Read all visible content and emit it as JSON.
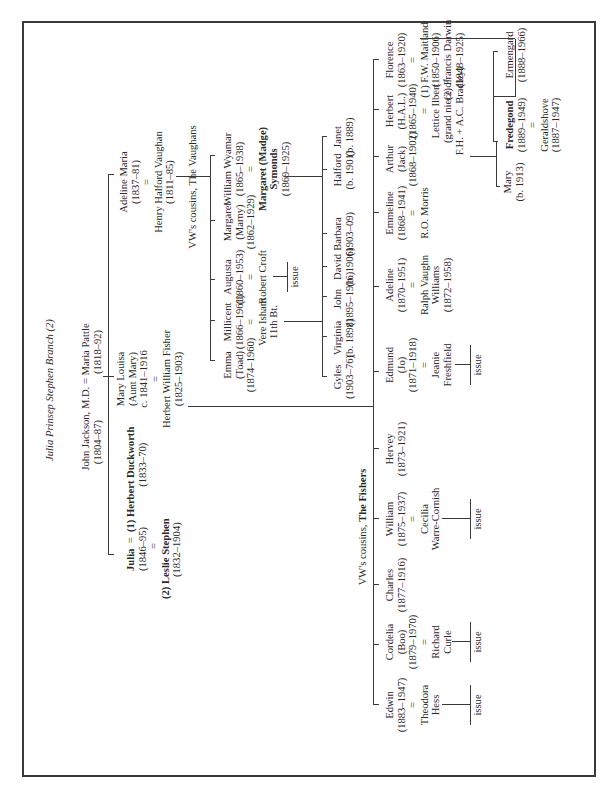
{
  "title": "Julia Prinsep Stephen Branch (2)",
  "root": {
    "line1": "John Jackson, M.D. = Maria Pattle",
    "line2_left": "(1804–87)",
    "line2_right": "(1818–92)"
  },
  "gen1": {
    "julia": {
      "name": "Julia",
      "eq": "=",
      "dates": "(1846–95)",
      "eq2": "=",
      "spouse1": "(1) Herbert Duckworth",
      "spouse1_dates": "(1833–70)",
      "spouse2": "(2) Leslie Stephen",
      "spouse2_dates": "(1832–1904)"
    },
    "mary_louisa": {
      "name": "Mary Louisa",
      "nick": "(Aunt Mary)",
      "dates": "c. 1841–1916",
      "eq": "=",
      "spouse": "Herbert William Fisher",
      "spouse_dates": "(1825–1903)"
    },
    "adeline_maria": {
      "name": "Adeline Maria",
      "dates": "(1837–81)",
      "eq": "=",
      "spouse": "Henry Halford Vaughan",
      "spouse_dates": "(1811–85)"
    }
  },
  "vaughans": {
    "heading": "VW's cousins, The Vaughans",
    "children": [
      {
        "name": "William Wyamar",
        "dates": "(1865–1938)",
        "eq": "=",
        "spouse": "Margaret (Madge)",
        "spouse2": "Symonds",
        "spouse_dates": "(1869–1925)"
      },
      {
        "name": "Margaret",
        "nick": "(Marny)",
        "dates": "(1862–1929)"
      },
      {
        "name": "Augusta",
        "dates": "(1860–1953)",
        "eq": "=",
        "spouse": "Robert Croft",
        "issue": "issue"
      },
      {
        "name": "Millicent",
        "dates": "(1866–1961)",
        "eq": "=",
        "spouse": "Vere Isham",
        "spouse2": "11th Bt."
      },
      {
        "name": "Emma",
        "nick": "(Toad)",
        "dates": "(1874–1960)"
      }
    ],
    "wyamar_children": [
      {
        "name": "Janet",
        "dates": "(b. 1889)"
      },
      {
        "name": "Halford",
        "dates": "(b. 1901)"
      },
      {
        "name": "Barbara",
        "dates": "(1903–09)"
      },
      {
        "name": "David",
        "dates": "(b. 1906)"
      }
    ],
    "isham_children": [
      {
        "name": "John",
        "dates": "(1895–1916)"
      },
      {
        "name": "Virginia",
        "dates": "(b. 1898)"
      },
      {
        "name": "Gyles",
        "dates": "(1903–76)"
      }
    ]
  },
  "fishers": {
    "heading_prefix": "VW's cousins, ",
    "heading_bold": "The Fishers",
    "children": [
      {
        "name": "Florence",
        "dates": "(1863–1920)",
        "eq": "=",
        "spouse1": "(1) F.W. Maitland",
        "spouse1_dates": "(1850–1906)",
        "spouse2": "(2) Francis Darwin",
        "spouse2_dates": "(1848–1925)"
      },
      {
        "name": "Herbert",
        "nick": "(H.A.L.)",
        "dates": "(1865–1940)",
        "eq": "=",
        "spouse": "Lettice Ilbert",
        "spouse_note1": "(grand niece of",
        "spouse_note2": "F.H. + A.C. Bradley)"
      },
      {
        "name": "Arthur",
        "nick": "(Jack)",
        "dates": "(1868–1902)"
      },
      {
        "name": "Emmeline",
        "dates": "(1868–1941)",
        "eq": "=",
        "spouse": "R.O. Morris"
      },
      {
        "name": "Adeline",
        "dates": "(1870–1951)",
        "eq": "=",
        "spouse": "Ralph Vaughn",
        "spouse2": "Williams",
        "spouse_dates": "(1872–1958)"
      },
      {
        "name": "Edmund",
        "nick": "(Jo)",
        "dates": "(1871–1918)",
        "eq": "=",
        "spouse": "Jeanie",
        "spouse2": "Freshfield",
        "issue": "issue"
      },
      {
        "name": "Hervey",
        "dates": "(1873–1921)"
      },
      {
        "name": "William",
        "dates": "(1875–1937)",
        "eq": "=",
        "spouse": "Cecilia",
        "spouse2": "Warre-Cornish",
        "issue": "issue"
      },
      {
        "name": "Charles",
        "dates": "(1877–1916)"
      },
      {
        "name": "Cordelia",
        "nick": "(Boo)",
        "dates": "(1879–1970)",
        "eq": "=",
        "spouse": "Richard",
        "spouse2": "Curle",
        "issue": "issue"
      },
      {
        "name": "Edwin",
        "dates": "(1883–1947)",
        "eq": "=",
        "spouse": "Theodora",
        "spouse2": "Hess",
        "issue": "issue"
      }
    ],
    "florence_children": [
      {
        "name": "Ermengard",
        "dates": "(1888–1966)"
      },
      {
        "name": "Fredegond",
        "dates": "(1889–1949)",
        "eq": "=",
        "spouse": "Geraldshove",
        "spouse_dates": "(1887–1947)"
      }
    ],
    "herbert_children": [
      {
        "name": "Mary",
        "dates": "(b. 1913)"
      }
    ]
  }
}
